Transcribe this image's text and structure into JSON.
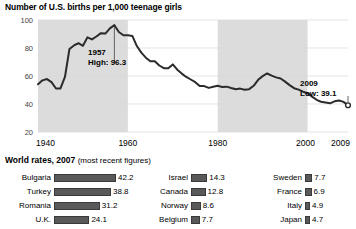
{
  "chart_title": "Number of U.S. births per 1,000 teenage girls",
  "section": {
    "heading_bold": "World rates, 2007",
    "heading_note": "(most recent figures)"
  },
  "annotations": {
    "high": {
      "year": "1957",
      "label": "High: 96.3",
      "value": 96.3
    },
    "low": {
      "year": "2009",
      "label": "Low: 39.1",
      "value": 39.1
    }
  },
  "colors": {
    "line": "#2b2b2b",
    "band": "#dcdcdc",
    "bar": "#595959",
    "grid": "#d8d8d8",
    "text": "#000000"
  },
  "chart_data": {
    "type": "line",
    "title": "Number of U.S. births per 1,000 teenage girls",
    "xlabel": "",
    "ylabel": "",
    "xlim": [
      1940,
      2009
    ],
    "ylim": [
      20,
      100
    ],
    "yticks": [
      20,
      40,
      60,
      80,
      100
    ],
    "xticks": [
      1940,
      1960,
      1980,
      2000,
      2009
    ],
    "xtick_labels": [
      "1940",
      "1960",
      "1980",
      "2000",
      "2009"
    ],
    "grid": true,
    "legend": "none",
    "shaded_bands": [
      {
        "from": 1940,
        "to": 1960
      },
      {
        "from": 1980,
        "to": 2000
      }
    ],
    "markers": [
      {
        "x": 2009,
        "y": 39.1,
        "style": "open-circle"
      }
    ],
    "x": [
      1940,
      1941,
      1942,
      1943,
      1944,
      1945,
      1946,
      1947,
      1948,
      1949,
      1950,
      1951,
      1952,
      1953,
      1954,
      1955,
      1956,
      1957,
      1958,
      1959,
      1960,
      1961,
      1962,
      1963,
      1964,
      1965,
      1966,
      1967,
      1968,
      1969,
      1970,
      1971,
      1972,
      1973,
      1974,
      1975,
      1976,
      1977,
      1978,
      1979,
      1980,
      1981,
      1982,
      1983,
      1984,
      1985,
      1986,
      1987,
      1988,
      1989,
      1990,
      1991,
      1992,
      1993,
      1994,
      1995,
      1996,
      1997,
      1998,
      1999,
      2000,
      2001,
      2002,
      2003,
      2004,
      2005,
      2006,
      2007,
      2008,
      2009
    ],
    "values": [
      54.1,
      56.9,
      57.8,
      55.6,
      51.1,
      51.1,
      59.3,
      79.3,
      81.8,
      83.4,
      81.6,
      87.6,
      86.1,
      88.2,
      90.6,
      90.3,
      94.0,
      96.3,
      91.4,
      89.1,
      89.1,
      88.6,
      81.4,
      76.7,
      73.1,
      70.5,
      70.6,
      67.5,
      65.6,
      65.5,
      68.3,
      64.5,
      61.7,
      59.3,
      57.5,
      55.6,
      52.8,
      52.8,
      51.5,
      52.3,
      53.0,
      52.2,
      52.4,
      51.4,
      50.6,
      51.0,
      50.2,
      50.6,
      53.0,
      57.3,
      59.9,
      61.8,
      60.3,
      59.0,
      58.2,
      56.0,
      53.5,
      51.3,
      50.3,
      48.8,
      47.7,
      45.3,
      43.0,
      41.6,
      41.1,
      40.5,
      41.9,
      42.5,
      41.5,
      39.1
    ]
  },
  "world_rates": {
    "columns": [
      {
        "rows": [
          {
            "country": "Bulgaria",
            "value": "42.2",
            "num": 42.2
          },
          {
            "country": "Turkey",
            "value": "38.8",
            "num": 38.8
          },
          {
            "country": "Romania",
            "value": "31.2",
            "num": 31.2
          },
          {
            "country": "U.K.",
            "value": "24.1",
            "num": 24.1
          }
        ]
      },
      {
        "rows": [
          {
            "country": "Israel",
            "value": "14.3",
            "num": 14.3
          },
          {
            "country": "Canada",
            "value": "12.8",
            "num": 12.8
          },
          {
            "country": "Norway",
            "value": "8.6",
            "num": 8.6
          },
          {
            "country": "Belgium",
            "value": "7.7",
            "num": 7.7
          }
        ]
      },
      {
        "rows": [
          {
            "country": "Sweden",
            "value": "7.7",
            "num": 7.7
          },
          {
            "country": "France",
            "value": "6.9",
            "num": 6.9
          },
          {
            "country": "Italy",
            "value": "4.9",
            "num": 4.9
          },
          {
            "country": "Japan",
            "value": "4.7",
            "num": 4.7
          }
        ]
      }
    ]
  }
}
